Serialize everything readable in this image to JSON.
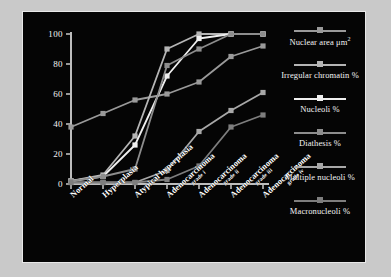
{
  "figure": {
    "page_background": "#c9c9c9",
    "panel_background": "#050505",
    "panel_border_color": "#e8e8e8"
  },
  "chart_data": {
    "type": "line",
    "title": "",
    "xlabel": "",
    "ylabel": "",
    "ylim": [
      0,
      100
    ],
    "yticks": [
      0,
      20,
      40,
      60,
      80,
      100
    ],
    "ytick_labels": [
      "0",
      "20",
      "40",
      "60",
      "80",
      "100"
    ],
    "grid": false,
    "legend_position": "right",
    "categories": [
      "Normal",
      "Hyperplasia",
      "Atypical hyperplasia",
      "Adenocarcinoma grade i",
      "Adenocarcinoma grade ii",
      "Adenocarcinoma grade iii",
      "Adenocarcinoma grade iv"
    ],
    "category_labels": [
      {
        "main": "Normal",
        "sub": ""
      },
      {
        "main": "Hyperplasia",
        "sub": ""
      },
      {
        "main": "Atypical hyperplasia",
        "sub": ""
      },
      {
        "main": "Adenocarcinoma",
        "sub": "grade i"
      },
      {
        "main": "Adenocarcinoma",
        "sub": "grade ii"
      },
      {
        "main": "Adenocarcinoma",
        "sub": "grade iii"
      },
      {
        "main": "Adenocarcinoma",
        "sub": "grade iv"
      }
    ],
    "series": [
      {
        "name": "Nuclear area μm²",
        "legend_label": "Nuclear area μm2",
        "color": "#9a9a9a",
        "values": [
          38,
          47,
          56,
          60,
          68,
          85,
          92
        ]
      },
      {
        "name": "Irregular chromatin %",
        "legend_label": "Irregular chromatin %",
        "color": "#b5b5b5",
        "values": [
          2,
          6,
          32,
          90,
          100,
          100,
          100
        ]
      },
      {
        "name": "Nucleoli %",
        "legend_label": "Nucleoli %",
        "color": "#efefef",
        "values": [
          2,
          5,
          26,
          72,
          97,
          100,
          100
        ]
      },
      {
        "name": "Diathesis %",
        "legend_label": "Diathesis %",
        "color": "#8d8d8d",
        "values": [
          2,
          5,
          10,
          79,
          90,
          100,
          100
        ]
      },
      {
        "name": "Multiple nucleoli %",
        "legend_label": "Multiple nucleoli %",
        "color": "#a8a8a8",
        "values": [
          1,
          1,
          1,
          9,
          35,
          49,
          61
        ]
      },
      {
        "name": "Macronucleoli %",
        "legend_label": "Macronucleoli %",
        "color": "#7e7e7e",
        "values": [
          1,
          1,
          1,
          3,
          12,
          38,
          46
        ]
      }
    ]
  },
  "legend": {
    "items": [
      "Nuclear area μm",
      "Irregular chromatin %",
      "Nucleoli %",
      "Diathesis %",
      "Multiple nucleoli %",
      "Macronucleoli %"
    ],
    "nuclear_area_exponent": "2"
  }
}
